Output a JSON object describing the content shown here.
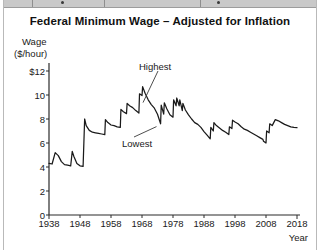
{
  "top_strip": {
    "present": true,
    "description": "clipped-toolbar-strip"
  },
  "chart_data": {
    "type": "line",
    "title": "Federal Minimum Wage – Adjusted for Inflation",
    "xlabel": "Year",
    "ylabel": "Wage",
    "ylabel_unit": "($/hour)",
    "xlim": [
      1938,
      2018
    ],
    "ylim": [
      0,
      12
    ],
    "grid": false,
    "legend": null,
    "line_color": "#1a1a1a",
    "xticks": [
      1938,
      1948,
      1958,
      1968,
      1978,
      1988,
      1998,
      2008,
      2018
    ],
    "xtick_labels": [
      "1938",
      "1948",
      "1958",
      "1968",
      "1978",
      "1988",
      "1998",
      "2008",
      "2018"
    ],
    "yticks": [
      0,
      2,
      4,
      6,
      8,
      10,
      12
    ],
    "ytick_labels": [
      "0",
      "2",
      "4",
      "6",
      "8",
      "10",
      "$12"
    ],
    "annotations": [
      {
        "label": "Highest",
        "points_to_year": 1968,
        "points_to_value": 10.7
      },
      {
        "label": "Lowest",
        "points_to_year": 1973,
        "points_to_value": 7.2
      }
    ],
    "x": [
      1938,
      1939,
      1940,
      1941,
      1942,
      1943,
      1944,
      1945,
      1945.5,
      1946,
      1947,
      1948,
      1949,
      1949.5,
      1950,
      1951,
      1952,
      1953,
      1954,
      1955,
      1956,
      1956.2,
      1957,
      1958,
      1959,
      1960,
      1961,
      1961.2,
      1962,
      1963,
      1963.2,
      1964,
      1965,
      1966,
      1967,
      1967.2,
      1968,
      1968.2,
      1969,
      1970,
      1971,
      1972,
      1973,
      1974,
      1974.2,
      1975,
      1975.2,
      1976,
      1977,
      1978,
      1978.2,
      1979,
      1979.2,
      1980,
      1980.2,
      1981,
      1981.2,
      1982,
      1983,
      1984,
      1985,
      1986,
      1987,
      1988,
      1989,
      1990,
      1990.2,
      1991,
      1991.2,
      1992,
      1993,
      1994,
      1995,
      1996,
      1996.2,
      1997,
      1997.2,
      1998,
      1999,
      2000,
      2001,
      2002,
      2003,
      2004,
      2005,
      2006,
      2007,
      2007.2,
      2008,
      2008.2,
      2009,
      2009.2,
      2010,
      2011,
      2012,
      2013,
      2014,
      2015,
      2016,
      2017,
      2018
    ],
    "y": [
      4.3,
      4.25,
      5.2,
      4.95,
      4.45,
      4.2,
      4.15,
      4.1,
      5.3,
      4.9,
      4.3,
      4.1,
      4.05,
      8.0,
      7.45,
      7.05,
      6.9,
      6.85,
      6.8,
      6.75,
      6.7,
      7.95,
      7.7,
      7.5,
      7.45,
      7.35,
      7.3,
      8.8,
      8.6,
      8.45,
      9.3,
      9.1,
      8.95,
      8.7,
      8.5,
      10.1,
      9.95,
      10.7,
      10.15,
      9.6,
      9.2,
      8.9,
      8.4,
      7.6,
      9.15,
      8.4,
      9.35,
      8.85,
      8.35,
      8.15,
      9.6,
      9.1,
      9.75,
      9.1,
      9.6,
      8.7,
      9.3,
      8.75,
      8.35,
      8.0,
      7.7,
      7.55,
      7.3,
      6.95,
      6.65,
      6.35,
      7.3,
      7.0,
      7.7,
      7.45,
      7.25,
      7.05,
      6.9,
      6.7,
      7.35,
      7.2,
      7.9,
      7.75,
      7.6,
      7.35,
      7.15,
      7.05,
      6.9,
      6.75,
      6.6,
      6.45,
      6.3,
      6.15,
      6.0,
      7.0,
      6.85,
      7.6,
      7.45,
      7.95,
      7.85,
      7.7,
      7.55,
      7.45,
      7.35,
      7.3,
      7.28,
      7.25
    ]
  }
}
